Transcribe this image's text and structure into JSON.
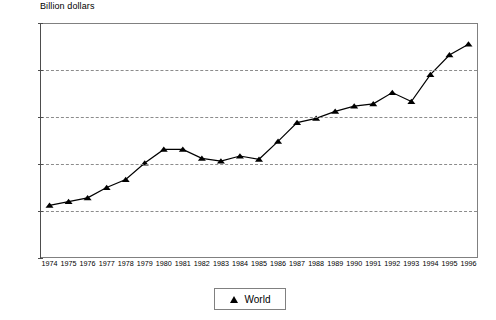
{
  "chart_data": {
    "type": "line",
    "title": "",
    "ylabel": "Billion dollars",
    "xlabel": "",
    "ylim": [
      0,
      500
    ],
    "yticks": [
      0,
      100,
      200,
      300,
      400,
      500
    ],
    "grid": "horizontal-dashed",
    "legend_position": "bottom-center",
    "marker": "triangle",
    "line_color": "#000000",
    "categories": [
      "1974",
      "1975",
      "1976",
      "1977",
      "1978",
      "1979",
      "1980",
      "1981",
      "1982",
      "1983",
      "1984",
      "1985",
      "1986",
      "1987",
      "1988",
      "1989",
      "1990",
      "1991",
      "1992",
      "1993",
      "1994",
      "1995",
      "1996"
    ],
    "series": [
      {
        "name": "World",
        "values": [
          112,
          120,
          128,
          150,
          167,
          202,
          231,
          231,
          212,
          206,
          217,
          210,
          248,
          288,
          297,
          312,
          323,
          328,
          352,
          333,
          390,
          432,
          455
        ]
      }
    ]
  },
  "legend": {
    "entries": [
      {
        "label": "World",
        "marker": "triangle-marker"
      }
    ]
  },
  "axis": {
    "y_title": "Billion dollars"
  }
}
